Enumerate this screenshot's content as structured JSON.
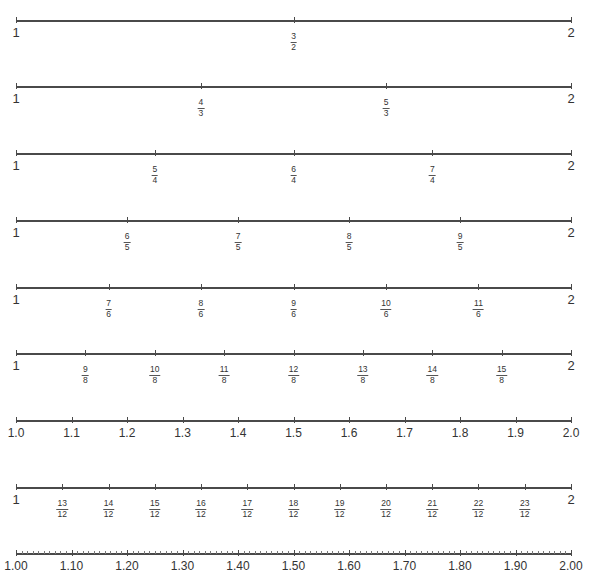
{
  "diagram": {
    "title": "",
    "line_color": "#4a4a4a",
    "rows": [
      {
        "id": "halves",
        "y": 20,
        "denominator": 2,
        "start": "1",
        "end": "2",
        "ticks": [
          {
            "num": "3",
            "den": "2",
            "pos": 0.5
          }
        ]
      },
      {
        "id": "thirds",
        "y": 86,
        "denominator": 3,
        "start": "1",
        "end": "2",
        "ticks": [
          {
            "num": "4",
            "den": "3",
            "pos": 0.3333
          },
          {
            "num": "5",
            "den": "3",
            "pos": 0.6667
          }
        ]
      },
      {
        "id": "fourths",
        "y": 153,
        "denominator": 4,
        "start": "1",
        "end": "2",
        "ticks": [
          {
            "num": "5",
            "den": "4",
            "pos": 0.25
          },
          {
            "num": "6",
            "den": "4",
            "pos": 0.5
          },
          {
            "num": "7",
            "den": "4",
            "pos": 0.75
          }
        ]
      },
      {
        "id": "fifths",
        "y": 220,
        "denominator": 5,
        "start": "1",
        "end": "2",
        "ticks": [
          {
            "num": "6",
            "den": "5",
            "pos": 0.2
          },
          {
            "num": "7",
            "den": "5",
            "pos": 0.4
          },
          {
            "num": "8",
            "den": "5",
            "pos": 0.6
          },
          {
            "num": "9",
            "den": "5",
            "pos": 0.8
          }
        ]
      },
      {
        "id": "sixths",
        "y": 287,
        "denominator": 6,
        "start": "1",
        "end": "2",
        "ticks": [
          {
            "num": "7",
            "den": "6",
            "pos": 0.1667
          },
          {
            "num": "8",
            "den": "6",
            "pos": 0.3333
          },
          {
            "num": "9",
            "den": "6",
            "pos": 0.5
          },
          {
            "num": "10",
            "den": "6",
            "pos": 0.6667
          },
          {
            "num": "11",
            "den": "6",
            "pos": 0.8333
          }
        ]
      },
      {
        "id": "eighths",
        "y": 353,
        "denominator": 8,
        "start": "1",
        "end": "2",
        "ticks": [
          {
            "num": "9",
            "den": "8",
            "pos": 0.125
          },
          {
            "num": "10",
            "den": "8",
            "pos": 0.25
          },
          {
            "num": "11",
            "den": "8",
            "pos": 0.375
          },
          {
            "num": "12",
            "den": "8",
            "pos": 0.5
          },
          {
            "num": "13",
            "den": "8",
            "pos": 0.625
          },
          {
            "num": "14",
            "den": "8",
            "pos": 0.75
          },
          {
            "num": "15",
            "den": "8",
            "pos": 0.875
          }
        ]
      },
      {
        "id": "tenths",
        "y": 420,
        "type": "decimal",
        "labels": [
          "1.0",
          "1.1",
          "1.2",
          "1.3",
          "1.4",
          "1.5",
          "1.6",
          "1.7",
          "1.8",
          "1.9",
          "2.0"
        ]
      },
      {
        "id": "twelfths",
        "y": 487,
        "denominator": 12,
        "start": "1",
        "end": "2",
        "ticks": [
          {
            "num": "13",
            "den": "12",
            "pos": 0.0833
          },
          {
            "num": "14",
            "den": "12",
            "pos": 0.1667
          },
          {
            "num": "15",
            "den": "12",
            "pos": 0.25
          },
          {
            "num": "16",
            "den": "12",
            "pos": 0.3333
          },
          {
            "num": "17",
            "den": "12",
            "pos": 0.4167
          },
          {
            "num": "18",
            "den": "12",
            "pos": 0.5
          },
          {
            "num": "19",
            "den": "12",
            "pos": 0.5833
          },
          {
            "num": "20",
            "den": "12",
            "pos": 0.6667
          },
          {
            "num": "21",
            "den": "12",
            "pos": 0.75
          },
          {
            "num": "22",
            "den": "12",
            "pos": 0.8333
          },
          {
            "num": "23",
            "den": "12",
            "pos": 0.9167
          }
        ]
      },
      {
        "id": "hundredths",
        "y": 553,
        "type": "decimal",
        "minor_ticks": 100,
        "labels": [
          "1.00",
          "1.10",
          "1.20",
          "1.30",
          "1.40",
          "1.50",
          "1.60",
          "1.70",
          "1.80",
          "1.90",
          "2.00"
        ]
      }
    ]
  }
}
